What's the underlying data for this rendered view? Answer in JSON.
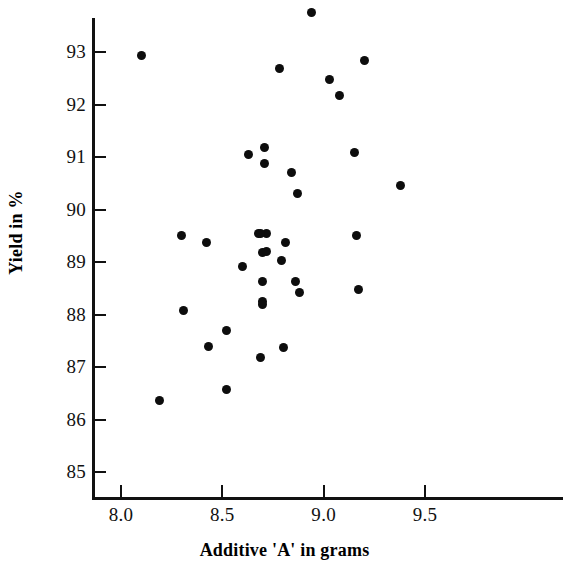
{
  "chart_data": {
    "type": "scatter",
    "title": "",
    "xlabel": "Additive 'A' in grams",
    "ylabel": "Yield in %",
    "xlim": [
      7.86,
      9.72
    ],
    "ylim": [
      84.55,
      93.9
    ],
    "grid": false,
    "legend": null,
    "xticks": [
      "8.0",
      "8.5",
      "9.0",
      "9.5"
    ],
    "xtick_values": [
      8.0,
      8.5,
      9.0,
      9.5
    ],
    "yticks": [
      "85",
      "86",
      "87",
      "88",
      "89",
      "90",
      "91",
      "92",
      "93"
    ],
    "ytick_values": [
      85,
      86,
      87,
      88,
      89,
      90,
      91,
      92,
      93
    ],
    "marker": "filled-circle",
    "marker_color": "#0d0d0d",
    "axis_color": "#111111",
    "background_color": "#ffffff",
    "n_points": 37,
    "points": [
      {
        "x": 8.1,
        "y": 92.93
      },
      {
        "x": 8.19,
        "y": 86.37
      },
      {
        "x": 8.3,
        "y": 89.5
      },
      {
        "x": 8.31,
        "y": 88.08
      },
      {
        "x": 8.42,
        "y": 89.37
      },
      {
        "x": 8.43,
        "y": 87.4
      },
      {
        "x": 8.52,
        "y": 86.58
      },
      {
        "x": 8.52,
        "y": 87.7
      },
      {
        "x": 8.6,
        "y": 88.92
      },
      {
        "x": 8.63,
        "y": 91.05
      },
      {
        "x": 8.68,
        "y": 89.55
      },
      {
        "x": 8.69,
        "y": 87.18
      },
      {
        "x": 8.7,
        "y": 89.18
      },
      {
        "x": 8.7,
        "y": 88.25
      },
      {
        "x": 8.7,
        "y": 88.62
      },
      {
        "x": 8.71,
        "y": 91.18
      },
      {
        "x": 8.71,
        "y": 90.87
      },
      {
        "x": 8.72,
        "y": 89.55
      },
      {
        "x": 8.78,
        "y": 92.68
      },
      {
        "x": 8.79,
        "y": 89.03
      },
      {
        "x": 8.8,
        "y": 87.37
      },
      {
        "x": 8.81,
        "y": 89.38
      },
      {
        "x": 8.84,
        "y": 90.7
      },
      {
        "x": 8.86,
        "y": 88.63
      },
      {
        "x": 8.87,
        "y": 90.3
      },
      {
        "x": 8.88,
        "y": 88.42
      },
      {
        "x": 8.94,
        "y": 93.75
      },
      {
        "x": 9.03,
        "y": 92.47
      },
      {
        "x": 9.08,
        "y": 92.18
      },
      {
        "x": 9.15,
        "y": 91.08
      },
      {
        "x": 9.16,
        "y": 89.5
      },
      {
        "x": 9.17,
        "y": 88.48
      },
      {
        "x": 9.2,
        "y": 92.83
      },
      {
        "x": 9.38,
        "y": 90.45
      },
      {
        "x": 8.69,
        "y": 89.55
      },
      {
        "x": 8.7,
        "y": 88.2
      },
      {
        "x": 8.72,
        "y": 89.2
      }
    ]
  },
  "axes": {
    "x_title": "Additive 'A' in grams",
    "y_title": "Yield in %"
  }
}
